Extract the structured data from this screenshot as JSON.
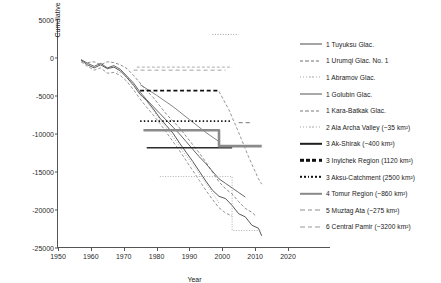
{
  "chart_data": {
    "type": "line",
    "title": "",
    "xlabel": "Year",
    "ylabel": "Cumulative mass balance (mm/we/year)",
    "xlim": [
      1950,
      2020
    ],
    "ylim": [
      -25000,
      5000
    ],
    "xticks": [
      1950,
      1960,
      1970,
      1980,
      1990,
      2000,
      2010,
      2020
    ],
    "yticks": [
      5000,
      0,
      -5000,
      -10000,
      -15000,
      -20000,
      -25000
    ],
    "grid": false,
    "legend_position": "right",
    "series": [
      {
        "name": "1 Tuyuksu Glac.",
        "style": "solid",
        "color": "#444444",
        "width": 0.9,
        "points": [
          [
            1957,
            -300
          ],
          [
            1959,
            -900
          ],
          [
            1961,
            -1300
          ],
          [
            1963,
            -900
          ],
          [
            1965,
            -1400
          ],
          [
            1967,
            -1200
          ],
          [
            1969,
            -1700
          ],
          [
            1971,
            -2600
          ],
          [
            1973,
            -3600
          ],
          [
            1975,
            -4800
          ],
          [
            1977,
            -5600
          ],
          [
            1979,
            -6700
          ],
          [
            1981,
            -7900
          ],
          [
            1983,
            -8900
          ],
          [
            1985,
            -9900
          ],
          [
            1987,
            -11200
          ],
          [
            1989,
            -12400
          ],
          [
            1991,
            -13600
          ],
          [
            1993,
            -14900
          ],
          [
            1995,
            -16200
          ],
          [
            1997,
            -17400
          ],
          [
            1999,
            -18200
          ],
          [
            2001,
            -18500
          ],
          [
            2003,
            -19400
          ],
          [
            2005,
            -20500
          ],
          [
            2007,
            -20900
          ],
          [
            2009,
            -22000
          ],
          [
            2011,
            -22400
          ],
          [
            2012,
            -23400
          ]
        ]
      },
      {
        "name": "1 Urumqi Glac. No. 1",
        "style": "dashed",
        "color": "#6f6f6f",
        "width": 0.8,
        "points": [
          [
            1959,
            -600
          ],
          [
            1961,
            -500
          ],
          [
            1963,
            -900
          ],
          [
            1965,
            -500
          ],
          [
            1967,
            -600
          ],
          [
            1969,
            -900
          ],
          [
            1971,
            -1400
          ],
          [
            1973,
            -2300
          ],
          [
            1975,
            -3300
          ],
          [
            1977,
            -4300
          ],
          [
            1979,
            -5200
          ],
          [
            1981,
            -6300
          ],
          [
            1983,
            -7400
          ],
          [
            1985,
            -8300
          ],
          [
            1987,
            -9200
          ],
          [
            1989,
            -10300
          ],
          [
            1991,
            -11400
          ],
          [
            1993,
            -12500
          ],
          [
            1995,
            -13700
          ],
          [
            1997,
            -15000
          ],
          [
            1999,
            -16300
          ],
          [
            2001,
            -17200
          ],
          [
            2003,
            -17900
          ],
          [
            2005,
            -18900
          ],
          [
            2007,
            -19800
          ],
          [
            2009,
            -20300
          ],
          [
            2010,
            -20700
          ]
        ]
      },
      {
        "name": "1 Abramov Glac.",
        "style": "dotted",
        "color": "#9a9a9a",
        "width": 0.8,
        "points": [
          [
            1968,
            -1800
          ],
          [
            1970,
            -2100
          ],
          [
            1972,
            -2900
          ],
          [
            1974,
            -4100
          ],
          [
            1976,
            -5200
          ],
          [
            1978,
            -6300
          ],
          [
            1980,
            -7500
          ],
          [
            1982,
            -8700
          ],
          [
            1984,
            -9800
          ],
          [
            1986,
            -11000
          ],
          [
            1988,
            -12300
          ],
          [
            1990,
            -13400
          ],
          [
            1992,
            -14600
          ],
          [
            1994,
            -15900
          ],
          [
            1996,
            -17100
          ],
          [
            1998,
            -18400
          ],
          [
            1999,
            -19100
          ]
        ]
      },
      {
        "name": "1 Golubin Glac.",
        "style": "solid",
        "color": "#555555",
        "width": 0.9,
        "points": [
          [
            1957,
            -200
          ],
          [
            1959,
            -700
          ],
          [
            1961,
            -1100
          ],
          [
            1963,
            -700
          ],
          [
            1965,
            -1300
          ],
          [
            1967,
            -1000
          ],
          [
            1969,
            -1500
          ],
          [
            1971,
            -2400
          ],
          [
            1973,
            -3300
          ],
          [
            1975,
            -4500
          ],
          [
            1977,
            -5500
          ],
          [
            1979,
            -6400
          ],
          [
            1981,
            -7300
          ],
          [
            1983,
            -8200
          ],
          [
            1985,
            -9100
          ],
          [
            1987,
            -10000
          ],
          [
            1989,
            -11000
          ],
          [
            1991,
            -12000
          ],
          [
            1993,
            -13000
          ],
          [
            1995,
            -13900
          ],
          [
            1997,
            -14900
          ],
          [
            1999,
            -15900
          ],
          [
            2001,
            -16500
          ],
          [
            2003,
            -17100
          ],
          [
            2005,
            -17700
          ],
          [
            2007,
            -18300
          ]
        ]
      },
      {
        "name": "1 Kara-Batkak Glac.",
        "style": "dashed",
        "color": "#7a7a7a",
        "width": 0.8,
        "points": [
          [
            1957,
            -500
          ],
          [
            1959,
            -1100
          ],
          [
            1961,
            -1600
          ],
          [
            1963,
            -1300
          ],
          [
            1965,
            -2000
          ],
          [
            1967,
            -1900
          ],
          [
            1969,
            -2300
          ],
          [
            1971,
            -3100
          ],
          [
            1973,
            -4200
          ],
          [
            1975,
            -5400
          ],
          [
            1977,
            -6500
          ],
          [
            1979,
            -7500
          ],
          [
            1981,
            -8600
          ],
          [
            1983,
            -9800
          ],
          [
            1985,
            -11000
          ],
          [
            1987,
            -12200
          ],
          [
            1989,
            -13500
          ],
          [
            1991,
            -14800
          ],
          [
            1993,
            -16100
          ],
          [
            1995,
            -17400
          ],
          [
            1997,
            -18600
          ],
          [
            1999,
            -19700
          ],
          [
            2001,
            -20400
          ],
          [
            2003,
            -20800
          ]
        ]
      },
      {
        "name": "2 Ala Archa Valley (~35 km²)",
        "style": "dotted",
        "color": "#a5a5a5",
        "width": 0.9,
        "points": [
          [
            1981,
            -15600
          ],
          [
            2003,
            -15600
          ],
          [
            2003,
            -22700
          ],
          [
            2012,
            -22700
          ]
        ]
      },
      {
        "name": "3 Ak-Shirak (~400 km²)",
        "style": "solid",
        "color": "#2b2b2b",
        "width": 1.5,
        "points": [
          [
            1977,
            -11800
          ],
          [
            2003,
            -11800
          ]
        ]
      },
      {
        "name": "3 Inylchek Region (1120 km²)",
        "style": "dashed",
        "color": "#111111",
        "width": 1.8,
        "points": [
          [
            1975,
            -4300
          ],
          [
            1999,
            -4300
          ]
        ]
      },
      {
        "name": "3 Aksu-Catchment (2500 km²)",
        "style": "dotted",
        "color": "#111111",
        "width": 1.6,
        "points": [
          [
            1975,
            -8300
          ],
          [
            2003,
            -8300
          ]
        ]
      },
      {
        "name": "4 Tomur Region (~860 km²)",
        "style": "solid",
        "color": "#8a8a8a",
        "width": 2.6,
        "points": [
          [
            1976,
            -9500
          ],
          [
            1999,
            -9500
          ],
          [
            1999,
            -11600
          ],
          [
            2012,
            -11600
          ]
        ]
      },
      {
        "name": "5 Muztag Ata (~275 km²)",
        "style": "longdash",
        "color": "#8f8f8f",
        "width": 1.2,
        "points": [
          [
            2005,
            -8500
          ],
          [
            2009,
            -8500
          ]
        ]
      },
      {
        "name": "6 Central Pamir (~3200 km²)",
        "style": "longdash",
        "color": "#9a9a9a",
        "width": 0.9,
        "points": [
          [
            1973,
            -1600
          ],
          [
            2001,
            -1600
          ]
        ]
      }
    ],
    "extra_paths": [
      {
        "name": "upper-dotted-segment",
        "style": "dotted",
        "color": "#9a9a9a",
        "width": 0.9,
        "points": [
          [
            1997,
            3100
          ],
          [
            2005,
            3100
          ]
        ]
      },
      {
        "name": "upper-dashdot-segment",
        "style": "dashed",
        "color": "#9a9a9a",
        "width": 0.8,
        "points": [
          [
            1974,
            -1200
          ],
          [
            2003,
            -1200
          ]
        ]
      },
      {
        "name": "inylchek-descending-curve",
        "style": "dashed",
        "color": "#8a8a8a",
        "width": 0.9,
        "points": [
          [
            1999,
            -4400
          ],
          [
            2002,
            -6800
          ],
          [
            2005,
            -9800
          ],
          [
            2008,
            -13000
          ],
          [
            2011,
            -15900
          ],
          [
            2012,
            -16600
          ]
        ]
      },
      {
        "name": "aksu-descending-curve",
        "style": "solid",
        "color": "#777777",
        "width": 0.9,
        "points": [
          [
            1975,
            -3500
          ],
          [
            1980,
            -4900
          ],
          [
            1985,
            -6400
          ],
          [
            1990,
            -8100
          ],
          [
            1995,
            -9800
          ],
          [
            1999,
            -11000
          ]
        ]
      }
    ]
  },
  "axes": {
    "y_ticks": [
      "5000",
      "0",
      "-5000",
      "-10000",
      "-15000",
      "-20000",
      "-25000"
    ],
    "x_ticks": [
      "1950",
      "1960",
      "1970",
      "1980",
      "1990",
      "2000",
      "2010",
      "2020"
    ],
    "x_title": "Year",
    "y_title": "Cumulative mass balance (mm/we/year)"
  },
  "legend": {
    "items": [
      {
        "label": "1 Tuyuksu Glac.",
        "style": "solid",
        "color": "#4a4a4a",
        "thick": false
      },
      {
        "label": "1 Urumqi Glac. No. 1",
        "style": "dashed",
        "color": "#6f6f6f",
        "thick": false
      },
      {
        "label": "1 Abramov Glac.",
        "style": "dotted",
        "color": "#a8a8a8",
        "thick": false
      },
      {
        "label": "1 Golubin Glac.",
        "style": "solid",
        "color": "#555555",
        "thick": false
      },
      {
        "label": "1 Kara-Batkak Glac.",
        "style": "dashed",
        "color": "#7a7a7a",
        "thick": false
      },
      {
        "label": "2 Ala Archa Valley (~35 km²)",
        "style": "dotted",
        "color": "#a8a8a8",
        "thick": false
      },
      {
        "label": "3 Ak-Shirak (~400 km²)",
        "style": "solid",
        "color": "#1f1f1f",
        "thick": true
      },
      {
        "label": "3 Inylchek Region (1120 km²)",
        "style": "dashed",
        "color": "#111111",
        "thick": true
      },
      {
        "label": "3 Aksu-Catchment (2500 km²)",
        "style": "dotted",
        "color": "#111111",
        "thick": true
      },
      {
        "label": "4 Tomur Region (~860 km²)",
        "style": "solid",
        "color": "#8a8a8a",
        "thick": true
      },
      {
        "label": "5 Muztag Ata (~275 km²)",
        "style": "longdash",
        "color": "#8f8f8f",
        "thick": false
      },
      {
        "label": "6 Central Pamir (~3200 km²)",
        "style": "longdash",
        "color": "#9a9a9a",
        "thick": false
      }
    ]
  }
}
